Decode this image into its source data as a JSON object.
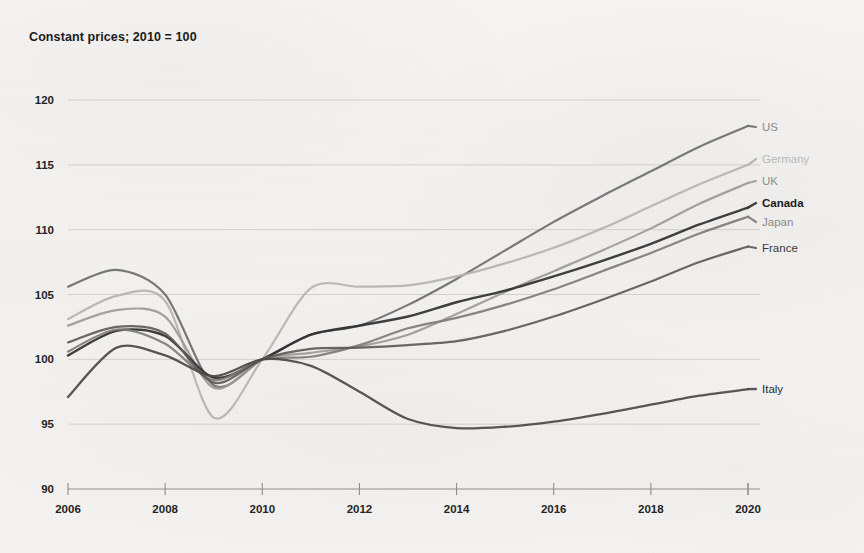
{
  "chart_title": "Constant prices; 2010 = 100",
  "axis": {
    "y_ticks": [
      "120",
      "115",
      "110",
      "105",
      "100",
      "95",
      "90"
    ],
    "x_ticks": [
      "2006",
      "2008",
      "2010",
      "2012",
      "2014",
      "2016",
      "2018",
      "2020"
    ],
    "ylim": [
      90,
      120
    ],
    "xlim": [
      2006,
      2020
    ]
  },
  "labels": {
    "us": "US",
    "germany": "Germany",
    "uk": "UK",
    "canada": "Canada",
    "japan": "Japan",
    "france": "France",
    "italy": "Italy"
  },
  "chart_data": {
    "type": "line",
    "title": "Constant prices; 2010 = 100",
    "xlabel": "",
    "ylabel": "",
    "xlim": [
      2006,
      2020
    ],
    "ylim": [
      90,
      120
    ],
    "grid": true,
    "legend_position": "right-end-of-line",
    "x": [
      2006,
      2007,
      2008,
      2009,
      2010,
      2011,
      2012,
      2013,
      2014,
      2015,
      2016,
      2017,
      2018,
      2019,
      2020
    ],
    "series": [
      {
        "name": "US",
        "color": "#6e6e6e",
        "label_color": "#8a8a8a",
        "width": 2.2,
        "values": [
          105.6,
          106.9,
          105.0,
          98.0,
          100.0,
          101.9,
          102.6,
          104.2,
          106.2,
          108.4,
          110.6,
          112.6,
          114.5,
          116.4,
          118.0
        ]
      },
      {
        "name": "Germany",
        "color": "#b4b3b1",
        "label_color": "#b9b8b6",
        "width": 2.2,
        "values": [
          103.1,
          104.9,
          104.5,
          95.5,
          100.0,
          105.5,
          105.6,
          105.7,
          106.4,
          107.4,
          108.6,
          110.1,
          111.8,
          113.5,
          115.0
        ]
      },
      {
        "name": "UK",
        "color": "#9b9a98",
        "label_color": "#8e8d8b",
        "width": 2.2,
        "values": [
          102.6,
          103.8,
          103.3,
          97.8,
          100.0,
          100.5,
          101.0,
          101.9,
          103.5,
          105.2,
          106.8,
          108.4,
          110.1,
          112.0,
          113.6
        ]
      },
      {
        "name": "Canada",
        "color": "#2f2f2f",
        "label_color": "#1b1b1b",
        "width": 2.4,
        "values": [
          100.3,
          102.2,
          101.8,
          98.6,
          100.0,
          101.9,
          102.6,
          103.3,
          104.4,
          105.3,
          106.4,
          107.6,
          108.9,
          110.4,
          111.7
        ]
      },
      {
        "name": "Japan",
        "color": "#7d7c7a",
        "label_color": "#8b8a88",
        "width": 2.2,
        "values": [
          100.6,
          102.3,
          101.2,
          98.4,
          100.0,
          100.2,
          101.1,
          102.4,
          103.2,
          104.2,
          105.4,
          106.8,
          108.2,
          109.7,
          111.0
        ]
      },
      {
        "name": "France",
        "color": "#5c5b59",
        "label_color": "#3b3a38",
        "width": 2.2,
        "values": [
          101.3,
          102.5,
          102.0,
          98.2,
          100.0,
          100.8,
          100.9,
          101.1,
          101.4,
          102.2,
          103.3,
          104.6,
          106.0,
          107.5,
          108.7
        ]
      },
      {
        "name": "Italy",
        "color": "#4a4947",
        "label_color": "#2a2a28",
        "width": 2.3,
        "values": [
          97.1,
          100.9,
          100.3,
          98.7,
          100.0,
          99.5,
          97.5,
          95.4,
          94.7,
          94.8,
          95.2,
          95.8,
          96.5,
          97.2,
          97.7
        ]
      }
    ]
  }
}
